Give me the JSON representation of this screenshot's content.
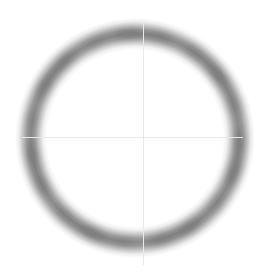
{
  "image": {
    "title": "Ring Phantom Scan",
    "width": 279,
    "height": 272,
    "background_color": "#ffffff",
    "modality_label": "grayscale-scan"
  },
  "chart_data": {
    "type": "heatmap",
    "title": "Ring Phantom Scan",
    "subtitle": "",
    "xlabel": "",
    "ylabel": "",
    "grid": false,
    "legend": "none",
    "colormap": "grayscale",
    "background_color": "#ffffff",
    "annulus": {
      "shape": "annulus",
      "center_x": 135,
      "center_y": 138,
      "outer_radius": 113,
      "inner_radius": 98,
      "ring_thickness": 15,
      "edge_blur_px": 6,
      "peak_gray_hex": "#808080",
      "peak_gray_value": 128,
      "rim_gray_hex": "#c8c8c8"
    },
    "intensity_profile": {
      "description": "Radial intensity across the annulus, 0 = white background, 1 = darkest gray",
      "radius": [
        88,
        92,
        96,
        100,
        104,
        108,
        112,
        116,
        120
      ],
      "intensity": [
        0.0,
        0.12,
        0.45,
        0.82,
        1.0,
        0.86,
        0.5,
        0.15,
        0.0
      ]
    },
    "xlim": [
      0,
      279
    ],
    "ylim": [
      0,
      272
    ]
  },
  "overlay": {
    "crosshair": {
      "label": "measurement-crosshair",
      "color": "#e9e9e9",
      "center_x": 143,
      "center_y": 137,
      "vertical_top": 22,
      "vertical_bottom": 265,
      "horizontal_left": 22,
      "horizontal_right": 243,
      "line_width": 1
    },
    "bottom_ticks": {
      "label": "cropped-scale-ticks",
      "color": "#f4f4f4",
      "left": 150,
      "top": 265,
      "width": 66,
      "height": 7,
      "marks": [
        "'",
        "'",
        "'",
        "'",
        "'"
      ]
    }
  }
}
